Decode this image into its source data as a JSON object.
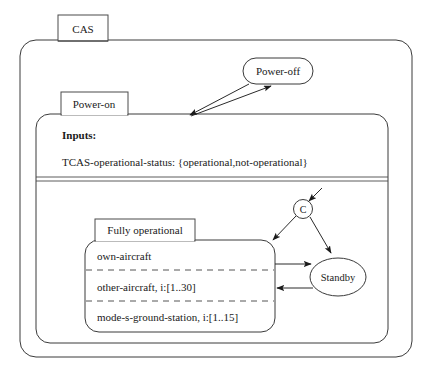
{
  "diagram": {
    "type": "statechart",
    "root_state": "CAS",
    "states": [
      {
        "id": "cas",
        "label": "CAS",
        "kind": "superstate",
        "shape": "rounded-rect-with-tab"
      },
      {
        "id": "power-off",
        "label": "Power-off",
        "kind": "state",
        "shape": "stadium"
      },
      {
        "id": "power-on",
        "label": "Power-on",
        "kind": "superstate",
        "shape": "rounded-rect-with-tab"
      },
      {
        "id": "fully-operational",
        "label": "Fully operational",
        "kind": "superstate",
        "shape": "rounded-rect-with-tab"
      },
      {
        "id": "standby",
        "label": "Standby",
        "kind": "state",
        "shape": "ellipse"
      },
      {
        "id": "connector-c",
        "label": "C",
        "kind": "connector",
        "shape": "circle"
      }
    ],
    "inputs_section": {
      "heading": "Inputs:",
      "entries": [
        {
          "name": "TCAS-operational-status:",
          "values": "{operational,not-operational}",
          "full_text": "TCAS-operational-status: {operational,not-operational}"
        }
      ]
    },
    "parallel_regions": [
      {
        "label": "own-aircraft"
      },
      {
        "label": "other-aircraft, i:[1..30]"
      },
      {
        "label": "mode-s-ground-station, i:[1..15]"
      }
    ],
    "transitions": [
      {
        "from": "power-on",
        "to": "power-off",
        "label": ""
      },
      {
        "from": "power-off",
        "to": "power-on",
        "label": ""
      },
      {
        "from": "entry",
        "to": "connector-c",
        "label": ""
      },
      {
        "from": "connector-c",
        "to": "fully-operational",
        "label": ""
      },
      {
        "from": "connector-c",
        "to": "standby",
        "label": ""
      },
      {
        "from": "fully-operational",
        "to": "standby",
        "label": ""
      },
      {
        "from": "standby",
        "to": "fully-operational",
        "label": ""
      }
    ]
  },
  "style": {
    "line_color": "#3a3a3a",
    "text_color": "#1a1a1a",
    "background": "#ffffff",
    "dashed_color": "#555555"
  }
}
